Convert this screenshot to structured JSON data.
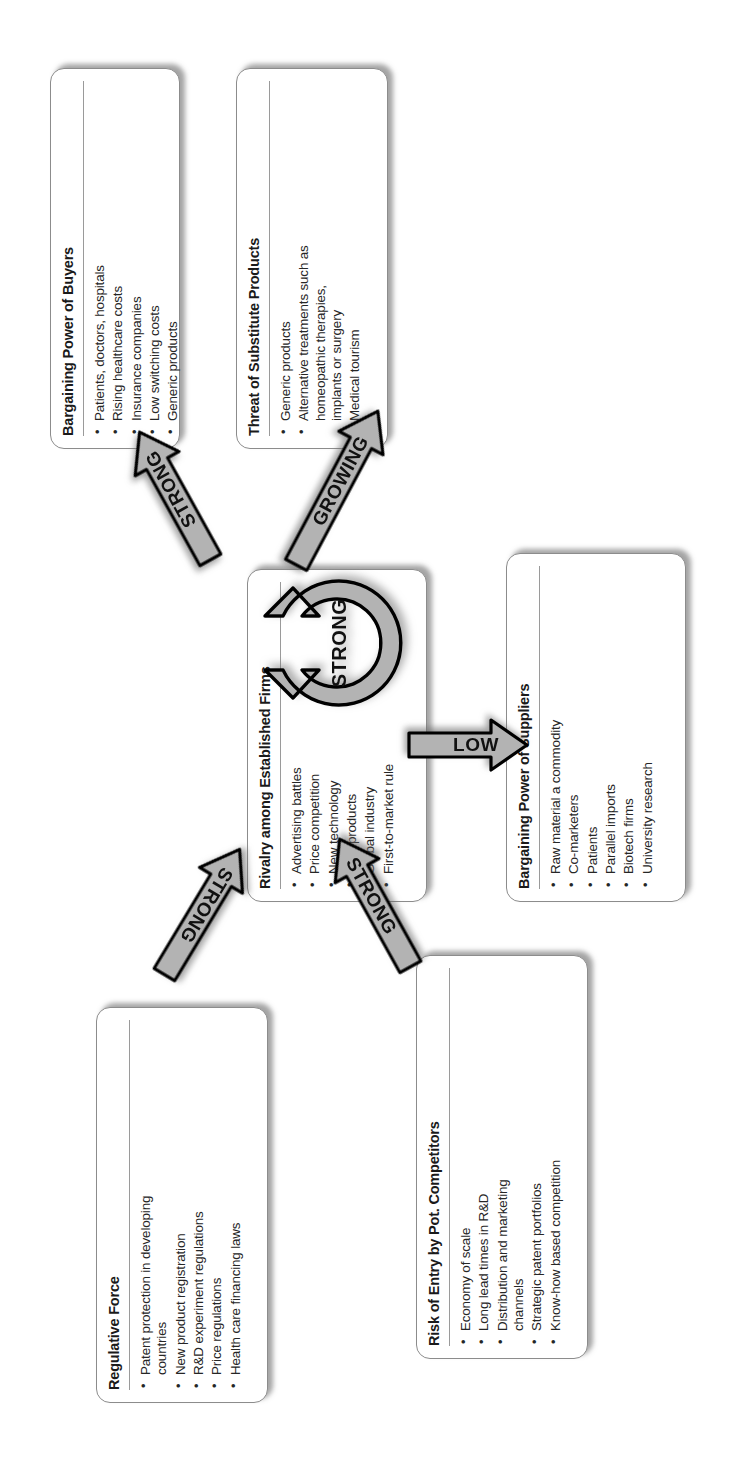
{
  "diagram": {
    "type": "porters-five-forces",
    "center": {
      "title": "Rivalry among Established Firms",
      "intensity_label": "STRONG",
      "items": [
        "Advertising battles",
        "Price competition",
        "New technology",
        "New products",
        "Global industry",
        "First-to-market rule"
      ]
    },
    "forces": [
      {
        "id": "buyers",
        "title": "Bargaining Power of Buyers",
        "items": [
          "Patients, doctors, hospitals",
          "Rising healthcare costs",
          "Insurance companies",
          "Low switching costs",
          "Generic products"
        ]
      },
      {
        "id": "substitutes",
        "title": "Threat of Substitute Products",
        "items": [
          "Generic products",
          "Alternative treatments such as",
          "homeopathic therapies,",
          "implants or surgery",
          "Medical tourism"
        ]
      },
      {
        "id": "suppliers",
        "title": "Bargaining Power of Suppliers",
        "items": [
          "Raw material a commodity",
          "Co-marketers",
          "Patients",
          "Parallel imports",
          "Biotech firms",
          "University research"
        ]
      },
      {
        "id": "entry",
        "title": "Risk of Entry by Pot. Competitors",
        "items": [
          "Economy of scale",
          "Long lead times in R&D",
          "Distribution and marketing",
          "channels",
          "Strategic patent portfolios",
          "Know-how based competition"
        ]
      },
      {
        "id": "regulative",
        "title": "Regulative Force",
        "items": [
          "Patent protection in developing",
          "countries",
          "New product registration",
          "R&D experiment regulations",
          "Price regulations",
          "Health care financing laws"
        ]
      }
    ],
    "arrows": [
      {
        "id": "buyers-arrow",
        "label": "STRONG"
      },
      {
        "id": "substitutes-arrow",
        "label": "GROWING"
      },
      {
        "id": "suppliers-arrow",
        "label": "LOW"
      },
      {
        "id": "entry-arrow",
        "label": "STRONG"
      },
      {
        "id": "regulative-arrow",
        "label": "STRONG"
      }
    ],
    "colors": {
      "arrow_fill": "#b3b3b3",
      "arrow_stroke": "#000000",
      "box_border": "#8c8c8c",
      "text": "#1a1a1a"
    }
  }
}
